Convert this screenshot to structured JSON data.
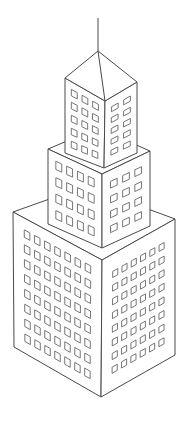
{
  "image": {
    "title": "Isometric skyscraper line drawing",
    "subject": "skyscraper",
    "style": "black outline on white",
    "colors": {
      "background": "#ffffff",
      "stroke": "#4a4a4a",
      "window_stroke": "#555555"
    }
  },
  "building": {
    "antenna": {
      "top": [
        98,
        18
      ],
      "bottom": [
        98,
        51
      ]
    },
    "roof": {
      "apex": [
        98,
        51
      ],
      "left": [
        65,
        78
      ],
      "right": [
        137,
        82
      ],
      "front": [
        105,
        101
      ]
    },
    "tiers": [
      {
        "name": "top",
        "left_face": {
          "cols": 3,
          "rows": 5
        },
        "right_face": {
          "cols": 2,
          "rows": 5
        },
        "corners": {
          "top_left": [
            65,
            78
          ],
          "top_front": [
            105,
            101
          ],
          "top_right": [
            137,
            82
          ],
          "bottom_left": [
            65,
            153
          ],
          "bottom_front": [
            104,
            168
          ],
          "bottom_right": [
            137,
            153
          ]
        }
      },
      {
        "name": "middle",
        "left_face": {
          "cols": 4,
          "rows": 4
        },
        "right_face": {
          "cols": 3,
          "rows": 4
        },
        "corners": {
          "top_left": [
            48,
            149
          ],
          "top_front": [
            102,
            174
          ],
          "top_right": [
            150,
            151
          ],
          "top_back": [
            98,
            128
          ],
          "bottom_left": [
            48,
            224
          ],
          "bottom_front": [
            102,
            248
          ],
          "bottom_right": [
            150,
            226
          ]
        }
      },
      {
        "name": "bottom",
        "left_face": {
          "cols": 7,
          "rows": 8
        },
        "right_face": {
          "cols": 6,
          "rows": 8
        },
        "corners": {
          "top_left": [
            13,
            212
          ],
          "top_front": [
            102,
            260
          ],
          "top_right": [
            175,
            219
          ],
          "top_back": [
            86,
            186
          ],
          "bottom_left": [
            14,
            347
          ],
          "bottom_front": [
            101,
            397
          ],
          "bottom_right": [
            175,
            355
          ]
        }
      }
    ]
  }
}
